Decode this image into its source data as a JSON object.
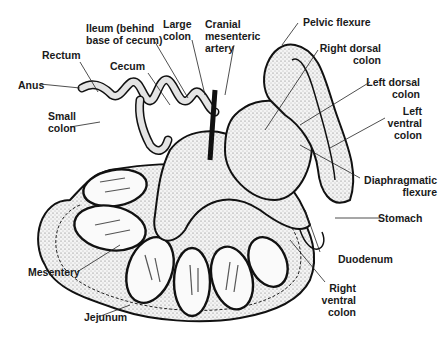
{
  "diagram": {
    "labels": [
      {
        "id": "anus",
        "text": "Anus"
      },
      {
        "id": "rectum",
        "text": "Rectum"
      },
      {
        "id": "small-colon",
        "text": "Small\ncolon",
        "line1": "Small",
        "line2": "colon"
      },
      {
        "id": "cecum",
        "text": "Cecum"
      },
      {
        "id": "ileum",
        "text": "Ileum (behind base of cecum)",
        "line1": "Ileum (behind",
        "line2": "base of cecum)"
      },
      {
        "id": "large-colon",
        "text": "Large colon",
        "line1": "Large",
        "line2": "colon"
      },
      {
        "id": "cranial-mesenteric-artery",
        "text": "Cranial mesenteric artery",
        "line1": "Cranial",
        "line2": "mesenteric",
        "line3": "artery"
      },
      {
        "id": "pelvic-flexure",
        "text": "Pelvic flexure"
      },
      {
        "id": "right-dorsal-colon",
        "text": "Right dorsal colon",
        "line1": "Right dorsal",
        "line2": "colon"
      },
      {
        "id": "left-dorsal-colon",
        "text": "Left dorsal colon",
        "line1": "Left dorsal",
        "line2": "colon"
      },
      {
        "id": "left-ventral-colon",
        "text": "Left ventral colon",
        "line1": "Left",
        "line2": "ventral",
        "line3": "colon"
      },
      {
        "id": "diaphragmatic-flexure",
        "text": "Diaphragmatic flexure",
        "line1": "Diaphragmatic",
        "line2": "flexure"
      },
      {
        "id": "stomach",
        "text": "Stomach"
      },
      {
        "id": "duodenum",
        "text": "Duodenum"
      },
      {
        "id": "right-ventral-colon",
        "text": "Right ventral colon",
        "line1": "Right",
        "line2": "ventral",
        "line3": "colon"
      },
      {
        "id": "mesentery",
        "text": "Mesentery"
      },
      {
        "id": "jejunum",
        "text": "Jejunum"
      }
    ]
  }
}
